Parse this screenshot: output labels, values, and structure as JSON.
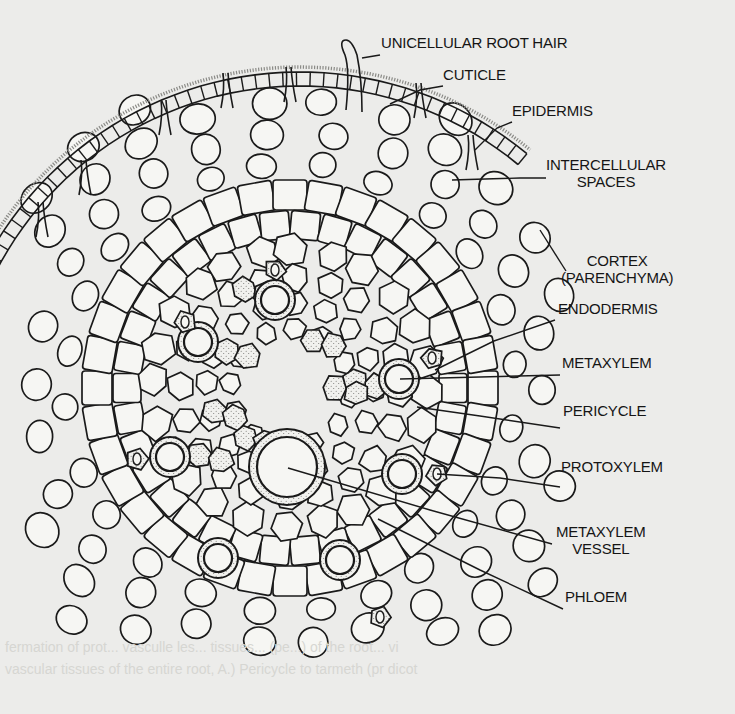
{
  "diagram": {
    "colors": {
      "background": "#ececea",
      "ink": "#1a1a1a",
      "cell_fill": "#f6f6f3",
      "stipple": "#8a8a86"
    },
    "labels": [
      {
        "id": "unicellular-root-hair",
        "text": "UNICELLULAR ROOT HAIR",
        "x": 381,
        "y": 46,
        "line": [
          [
            380,
            55
          ],
          [
            362,
            58
          ]
        ]
      },
      {
        "id": "cuticle",
        "text": "CUTICLE",
        "x": 443,
        "y": 78,
        "line": [
          [
            443,
            86
          ],
          [
            420,
            90
          ],
          [
            390,
            104
          ]
        ]
      },
      {
        "id": "epidermis",
        "text": "EPIDERMIS",
        "x": 512,
        "y": 114,
        "line": [
          [
            512,
            122
          ],
          [
            497,
            128
          ],
          [
            475,
            150
          ]
        ]
      },
      {
        "id": "intercellular-spaces",
        "text": "INTERCELLULAR\nSPACES",
        "x": 546,
        "y": 168,
        "line": [
          [
            546,
            178
          ],
          [
            520,
            178
          ],
          [
            452,
            180
          ]
        ]
      },
      {
        "id": "cortex-parenchyma",
        "text": "CORTEX\n(PARENCHYMA)",
        "x": 561,
        "y": 264,
        "line": [
          [
            566,
            271
          ],
          [
            540,
            230
          ]
        ]
      },
      {
        "id": "endodermis",
        "text": "ENDODERMIS",
        "x": 558,
        "y": 312,
        "line": [
          [
            555,
            320
          ],
          [
            494,
            341
          ],
          [
            435,
            370
          ]
        ]
      },
      {
        "id": "metaxylem",
        "text": "METAXYLEM",
        "x": 562,
        "y": 366,
        "line": [
          [
            560,
            375
          ],
          [
            400,
            379
          ]
        ]
      },
      {
        "id": "pericycle",
        "text": "PERICYCLE",
        "x": 563,
        "y": 414,
        "line": [
          [
            560,
            428
          ],
          [
            480,
            416
          ],
          [
            417,
            407
          ]
        ]
      },
      {
        "id": "protoxylem",
        "text": "PROTOXYLEM",
        "x": 561,
        "y": 470,
        "line": [
          [
            560,
            487
          ],
          [
            500,
            478
          ],
          [
            437,
            474
          ]
        ]
      },
      {
        "id": "metaxylem-vessel",
        "text": "METAXYLEM\nVESSEL",
        "x": 556,
        "y": 535,
        "line": [
          [
            552,
            544
          ],
          [
            430,
            510
          ],
          [
            288,
            468
          ]
        ]
      },
      {
        "id": "phloem",
        "text": "PHLOEM",
        "x": 565,
        "y": 600,
        "line": [
          [
            563,
            609
          ],
          [
            480,
            570
          ],
          [
            378,
            519
          ]
        ]
      }
    ],
    "bleed_through_text": [
      {
        "text": "fermation of prot... vasculle les... tissues... (pe...) of the root... vi",
        "x": 5,
        "y": 651
      },
      {
        "text": "vascular tissues of the entire root, A.) Pericycle to tarmeth (pr dicot",
        "x": 5,
        "y": 673
      }
    ]
  }
}
